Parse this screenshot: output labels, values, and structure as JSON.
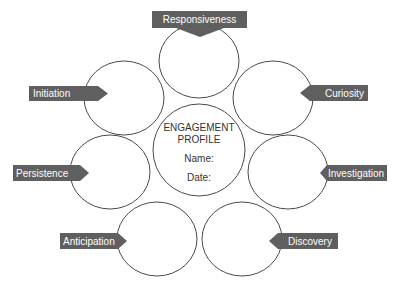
{
  "diagram": {
    "center": {
      "title_line1": "ENGAGEMENT",
      "title_line2": "PROFILE",
      "name_label": "Name:",
      "date_label": "Date:"
    },
    "petals": [
      {
        "label": "Responsiveness",
        "position": "top"
      },
      {
        "label": "Initiation",
        "position": "upper-left"
      },
      {
        "label": "Curiosity",
        "position": "upper-right"
      },
      {
        "label": "Persistence",
        "position": "middle-left"
      },
      {
        "label": "Investigation",
        "position": "middle-right"
      },
      {
        "label": "Anticipation",
        "position": "lower-left"
      },
      {
        "label": "Discovery",
        "position": "lower-right"
      }
    ],
    "colors": {
      "banner": "#5f5f5f",
      "outline": "#4a4a4a",
      "banner_text": "#ffffff"
    }
  }
}
